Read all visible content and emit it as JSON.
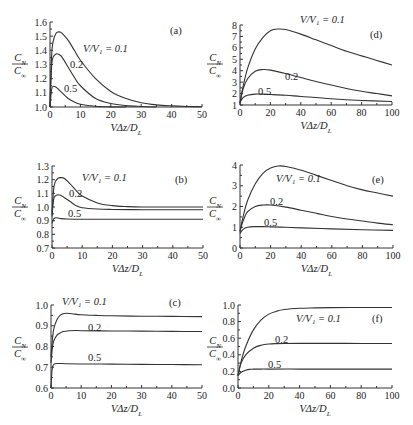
{
  "chart_data": [
    {
      "id": "a",
      "type": "line",
      "panel_label": "(a)",
      "xlabel": "VΔz/D_L",
      "ylabel": "C_N/C_∞",
      "xlim": [
        0,
        50
      ],
      "ylim": [
        1.0,
        1.6
      ],
      "xticks": [
        0,
        10,
        20,
        30,
        40,
        50
      ],
      "yticks": [
        1.0,
        1.1,
        1.2,
        1.3,
        1.4,
        1.5,
        1.6
      ],
      "ytick_labels": [
        "1.0",
        "1.1",
        "1.2",
        "1.3",
        "1.4",
        "1.5",
        "1.6"
      ],
      "series": [
        {
          "name": "V/V1 = 0.1",
          "label": "V/V₁ = 0.1",
          "x": [
            0,
            0.5,
            1,
            2,
            3,
            4,
            6,
            8,
            10,
            15,
            20,
            25,
            30,
            35,
            40,
            45,
            50
          ],
          "y": [
            1.0,
            1.35,
            1.46,
            1.52,
            1.53,
            1.52,
            1.47,
            1.4,
            1.33,
            1.2,
            1.11,
            1.06,
            1.03,
            1.015,
            1.008,
            1.004,
            1.002
          ]
        },
        {
          "name": "V/V1 = 0.2",
          "label": "0.2",
          "x": [
            0,
            0.5,
            1,
            2,
            3,
            4,
            6,
            8,
            10,
            15,
            20,
            25,
            30,
            35
          ],
          "y": [
            1.0,
            1.28,
            1.35,
            1.375,
            1.37,
            1.35,
            1.28,
            1.21,
            1.15,
            1.06,
            1.025,
            1.01,
            1.004,
            1.0
          ]
        },
        {
          "name": "V/V1 = 0.5",
          "label": "0.5",
          "x": [
            0,
            0.5,
            1,
            2,
            3,
            4,
            6,
            8,
            10,
            15,
            20,
            25
          ],
          "y": [
            1.0,
            1.12,
            1.145,
            1.14,
            1.12,
            1.1,
            1.06,
            1.035,
            1.02,
            1.005,
            1.001,
            1.0
          ]
        }
      ]
    },
    {
      "id": "d",
      "type": "line",
      "panel_label": "(d)",
      "xlabel": "VΔz/D_L",
      "ylabel": "C_N/C_∞",
      "xlim": [
        0,
        100
      ],
      "ylim": [
        1,
        8
      ],
      "xticks": [
        0,
        20,
        40,
        60,
        80,
        100
      ],
      "yticks": [
        1,
        2,
        3,
        4,
        5,
        6,
        7,
        8
      ],
      "ytick_labels": [
        "1",
        "2",
        "3",
        "4",
        "5",
        "6",
        "7",
        "8"
      ],
      "series": [
        {
          "name": "V/V1 = 0.1",
          "label": "V/V₁ = 0.1",
          "x": [
            0,
            2,
            5,
            10,
            15,
            20,
            25,
            30,
            40,
            50,
            60,
            70,
            80,
            90,
            100
          ],
          "y": [
            1.2,
            2.6,
            4.2,
            5.9,
            6.9,
            7.5,
            7.65,
            7.6,
            7.2,
            6.7,
            6.2,
            5.7,
            5.3,
            4.9,
            4.5
          ]
        },
        {
          "name": "V/V1 = 0.2",
          "label": "0.2",
          "x": [
            0,
            2,
            5,
            10,
            15,
            20,
            30,
            40,
            50,
            60,
            70,
            80,
            90,
            100
          ],
          "y": [
            1.2,
            2.4,
            3.3,
            3.95,
            4.1,
            4.05,
            3.75,
            3.4,
            3.05,
            2.75,
            2.45,
            2.2,
            2.0,
            1.8
          ]
        },
        {
          "name": "V/V1 = 0.5",
          "label": "0.5",
          "x": [
            0,
            2,
            5,
            10,
            15,
            20,
            30,
            40,
            60,
            80,
            100
          ],
          "y": [
            1.2,
            1.65,
            1.85,
            1.95,
            1.95,
            1.92,
            1.85,
            1.75,
            1.55,
            1.4,
            1.3
          ]
        }
      ]
    },
    {
      "id": "b",
      "type": "line",
      "panel_label": "(b)",
      "xlabel": "VΔz/D_L",
      "ylabel": "C_N/C_∞",
      "xlim": [
        0,
        50
      ],
      "ylim": [
        0.7,
        1.3
      ],
      "xticks": [
        0,
        10,
        20,
        30,
        40,
        50
      ],
      "yticks": [
        0.7,
        0.8,
        0.9,
        1.0,
        1.1,
        1.2,
        1.3
      ],
      "ytick_labels": [
        "0.7",
        "0.8",
        "0.9",
        "1.0",
        "1.1",
        "1.2",
        "1.3"
      ],
      "series": [
        {
          "name": "V/V1 = 0.1",
          "label": "V/V₁ = 0.1",
          "x": [
            0,
            0.5,
            1,
            2,
            3,
            4,
            6,
            8,
            10,
            15,
            20,
            25,
            30,
            40,
            50
          ],
          "y": [
            0.95,
            1.12,
            1.18,
            1.21,
            1.215,
            1.21,
            1.17,
            1.12,
            1.08,
            1.03,
            1.01,
            1.003,
            1.0,
            1.0,
            1.0
          ]
        },
        {
          "name": "V/V1 = 0.2",
          "label": "0.2",
          "x": [
            0,
            0.5,
            1,
            2,
            3,
            4,
            6,
            8,
            10,
            15,
            20,
            30,
            40,
            50
          ],
          "y": [
            0.93,
            1.05,
            1.08,
            1.09,
            1.085,
            1.07,
            1.04,
            1.01,
            0.995,
            0.985,
            0.982,
            0.98,
            0.98,
            0.98
          ]
        },
        {
          "name": "V/V1 = 0.5",
          "label": "0.5",
          "x": [
            0,
            0.5,
            1,
            2,
            3,
            5,
            10,
            20,
            30,
            40,
            50
          ],
          "y": [
            0.88,
            0.91,
            0.92,
            0.92,
            0.915,
            0.912,
            0.91,
            0.91,
            0.91,
            0.91,
            0.91
          ]
        }
      ]
    },
    {
      "id": "e",
      "type": "line",
      "panel_label": "(e)",
      "xlabel": "VΔz/D_L",
      "ylabel": "C_N/C_∞",
      "xlim": [
        0,
        100
      ],
      "ylim": [
        0,
        4
      ],
      "xticks": [
        0,
        20,
        40,
        60,
        80,
        100
      ],
      "yticks": [
        0,
        1,
        2,
        3,
        4
      ],
      "ytick_labels": [
        "0",
        "1",
        "2",
        "3",
        "4"
      ],
      "series": [
        {
          "name": "V/V1 = 0.1",
          "label": "V/V₁ = 0.1",
          "x": [
            0,
            2,
            5,
            10,
            15,
            20,
            25,
            30,
            40,
            50,
            60,
            70,
            80,
            90,
            100
          ],
          "y": [
            0.8,
            1.5,
            2.3,
            3.1,
            3.6,
            3.85,
            3.95,
            3.93,
            3.75,
            3.5,
            3.25,
            3.0,
            2.8,
            2.65,
            2.5
          ]
        },
        {
          "name": "V/V1 = 0.2",
          "label": "0.2",
          "x": [
            0,
            2,
            5,
            10,
            15,
            20,
            30,
            40,
            50,
            60,
            70,
            80,
            90,
            100
          ],
          "y": [
            0.8,
            1.3,
            1.75,
            2.0,
            2.07,
            2.07,
            1.97,
            1.82,
            1.67,
            1.52,
            1.4,
            1.3,
            1.2,
            1.12
          ]
        },
        {
          "name": "V/V1 = 0.5",
          "label": "0.5",
          "x": [
            0,
            2,
            5,
            10,
            15,
            20,
            30,
            40,
            60,
            80,
            100
          ],
          "y": [
            0.7,
            0.9,
            1.0,
            1.03,
            1.03,
            1.02,
            1.0,
            0.97,
            0.92,
            0.88,
            0.85
          ]
        }
      ]
    },
    {
      "id": "c",
      "type": "line",
      "panel_label": "(c)",
      "xlabel": "VΔz/D_L",
      "ylabel": "C_N/C_∞",
      "xlim": [
        0,
        50
      ],
      "ylim": [
        0.6,
        1.0
      ],
      "xticks": [
        0,
        10,
        20,
        30,
        40,
        50
      ],
      "yticks": [
        0.6,
        0.7,
        0.8,
        0.9,
        1.0
      ],
      "ytick_labels": [
        "0.6",
        "0.7",
        "0.8",
        "0.9",
        "1.0"
      ],
      "series": [
        {
          "name": "V/V1 = 0.1",
          "label": "V/V₁ = 0.1",
          "x": [
            0,
            0.5,
            1,
            2,
            3,
            4,
            5,
            7,
            10,
            15,
            20,
            30,
            40,
            50
          ],
          "y": [
            0.75,
            0.84,
            0.89,
            0.93,
            0.95,
            0.958,
            0.96,
            0.958,
            0.953,
            0.95,
            0.948,
            0.946,
            0.945,
            0.944
          ]
        },
        {
          "name": "V/V1 = 0.2",
          "label": "0.2",
          "x": [
            0,
            0.5,
            1,
            2,
            3,
            4,
            6,
            8,
            10,
            20,
            30,
            40,
            50
          ],
          "y": [
            0.72,
            0.8,
            0.83,
            0.855,
            0.865,
            0.872,
            0.876,
            0.877,
            0.876,
            0.875,
            0.874,
            0.873,
            0.872
          ]
        },
        {
          "name": "V/V1 = 0.5",
          "label": "0.5",
          "x": [
            0,
            0.3,
            0.6,
            1,
            2,
            3,
            5,
            10,
            20,
            30,
            40,
            50
          ],
          "y": [
            0.6,
            0.68,
            0.705,
            0.715,
            0.718,
            0.718,
            0.717,
            0.716,
            0.715,
            0.714,
            0.713,
            0.712
          ]
        }
      ]
    },
    {
      "id": "f",
      "type": "line",
      "panel_label": "(f)",
      "xlabel": "VΔz/D_L",
      "ylabel": "C_N/C_∞",
      "xlim": [
        0,
        100
      ],
      "ylim": [
        0.0,
        1.0
      ],
      "xticks": [
        0,
        20,
        40,
        60,
        80,
        100
      ],
      "yticks": [
        0.0,
        0.2,
        0.4,
        0.6,
        0.8,
        1.0
      ],
      "ytick_labels": [
        "0.0",
        "0.2",
        "0.4",
        "0.6",
        "0.8",
        "1.0"
      ],
      "series": [
        {
          "name": "V/V1 = 0.1",
          "label": "V/V₁ = 0.1",
          "x": [
            0,
            2,
            5,
            10,
            15,
            20,
            25,
            30,
            40,
            50,
            60,
            80,
            100
          ],
          "y": [
            0.15,
            0.32,
            0.5,
            0.7,
            0.82,
            0.89,
            0.925,
            0.945,
            0.96,
            0.965,
            0.968,
            0.97,
            0.97
          ]
        },
        {
          "name": "V/V1 = 0.2",
          "label": "0.2",
          "x": [
            0,
            2,
            5,
            10,
            15,
            20,
            25,
            30,
            40,
            60,
            80,
            100
          ],
          "y": [
            0.15,
            0.3,
            0.4,
            0.48,
            0.515,
            0.53,
            0.535,
            0.537,
            0.538,
            0.538,
            0.537,
            0.536
          ]
        },
        {
          "name": "V/V1 = 0.5",
          "label": "0.5",
          "x": [
            0,
            2,
            5,
            8,
            10,
            15,
            20,
            40,
            60,
            80,
            100
          ],
          "y": [
            0.15,
            0.19,
            0.215,
            0.225,
            0.227,
            0.228,
            0.228,
            0.228,
            0.227,
            0.227,
            0.227
          ]
        }
      ]
    }
  ],
  "labels": {
    "ylabel_num": "C",
    "ylabel_num_sub": "N",
    "ylabel_den": "C",
    "ylabel_den_sub": "∞",
    "xlabel_main": "VΔz/D",
    "xlabel_sub": "L"
  }
}
